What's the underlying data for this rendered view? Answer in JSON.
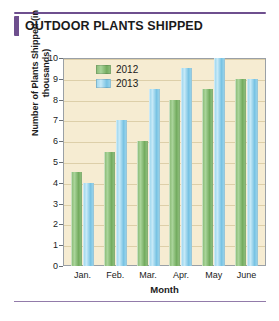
{
  "title": "OUTDOOR PLANTS SHIPPED",
  "legend": {
    "position": "top-left-inside",
    "entries": [
      {
        "label": "2012",
        "color": "#8cbd7a"
      },
      {
        "label": "2013",
        "color": "#96d2ea"
      }
    ]
  },
  "colors": {
    "accent": "#6e4f8e",
    "plot_background": "#f6ecd2",
    "gridline": "#ddcfa9",
    "axis": "#9aa0a6",
    "series_2012": "#8cbd7a",
    "series_2013": "#96d2ea"
  },
  "chart_data": {
    "type": "bar",
    "title": "OUTDOOR PLANTS SHIPPED",
    "xlabel": "Month",
    "ylabel": "Number of Plants Shipped (in thousands)",
    "categories": [
      "Jan.",
      "Feb.",
      "Mar.",
      "Apr.",
      "May",
      "June"
    ],
    "series": [
      {
        "name": "2012",
        "color": "#8cbd7a",
        "values": [
          4.5,
          5.5,
          6,
          8,
          8.5,
          9
        ]
      },
      {
        "name": "2013",
        "color": "#96d2ea",
        "values": [
          4,
          7,
          8.5,
          9.5,
          10,
          9
        ]
      }
    ],
    "ylim": [
      0,
      10
    ],
    "yticks": [
      0,
      1,
      2,
      3,
      4,
      5,
      6,
      7,
      8,
      9,
      10
    ],
    "ytick_labels": [
      "0",
      "1",
      "2",
      "3",
      "4",
      "5",
      "6",
      "7",
      "8",
      "9",
      "10"
    ],
    "grid": true,
    "legend_position": "upper left"
  }
}
